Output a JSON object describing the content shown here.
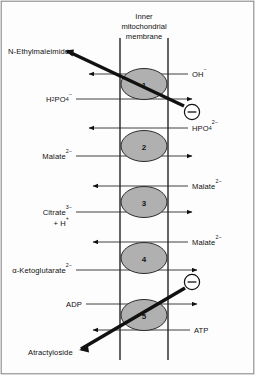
{
  "figure": {
    "title_lines": [
      "Inner",
      "mitochondrial",
      "membrane"
    ],
    "membrane": {
      "left_x": 120,
      "right_x": 168,
      "top_y": 38,
      "bottom_y": 360,
      "color": "#4a4a4a"
    },
    "frame": {
      "color": "#7a7a7a"
    },
    "carrier_fill": "#b0b0b0",
    "carrier_stroke": "#2b2b2b",
    "inhibitor_line_color": "#111111"
  },
  "carriers": [
    {
      "id": "carrier-1",
      "label": "1",
      "cx": 144,
      "cy": 84
    },
    {
      "id": "carrier-2",
      "label": "2",
      "cx": 144,
      "cy": 146
    },
    {
      "id": "carrier-3",
      "label": "3",
      "cx": 144,
      "cy": 202
    },
    {
      "id": "carrier-4",
      "label": "4",
      "cx": 144,
      "cy": 258
    },
    {
      "id": "carrier-5",
      "label": "5",
      "cx": 144,
      "cy": 315
    }
  ],
  "left_labels": [
    {
      "id": "label-nem",
      "text": "N-Ethylmaleimide",
      "x": 8,
      "y": 52
    },
    {
      "id": "label-h2po4",
      "base": "H",
      "sub": "2",
      "mid": "PO",
      "sub2": "4",
      "charge": "−",
      "x": 40,
      "y": 101
    },
    {
      "id": "label-malate-in",
      "base": "Malate",
      "charge": "2−",
      "x": 40,
      "y": 157
    },
    {
      "id": "label-citrate",
      "base": "Citrate",
      "charge": "3−",
      "second_line": "+ H",
      "second_charge": "+",
      "x": 40,
      "y": 213
    },
    {
      "id": "label-akg",
      "base": "α-Ketoglutarate",
      "charge": "2−",
      "x": 8,
      "y": 270
    },
    {
      "id": "label-adp",
      "text": "ADP",
      "x": 66,
      "y": 305
    },
    {
      "id": "label-atractyloside",
      "text": "Atractyloside",
      "x": 28,
      "y": 353
    }
  ],
  "right_labels": [
    {
      "id": "label-oh",
      "base": "OH",
      "charge": "−",
      "x": 192,
      "y": 74
    },
    {
      "id": "label-hpo4",
      "base": "HPO",
      "sub": "4",
      "charge": "2−",
      "x": 192,
      "y": 128
    },
    {
      "id": "label-malate-out-1",
      "base": "Malate",
      "charge": "2−",
      "x": 192,
      "y": 186
    },
    {
      "id": "label-malate-out-2",
      "base": "Malate",
      "charge": "2−",
      "x": 192,
      "y": 242
    },
    {
      "id": "label-atp",
      "text": "ATP",
      "x": 194,
      "y": 329
    }
  ],
  "arrows": [
    {
      "id": "arrow-oh-out",
      "direction": "left",
      "y": 74,
      "from_x": 188,
      "to_x": 88
    },
    {
      "id": "arrow-h2po4-in",
      "direction": "right",
      "y": 99,
      "from_x": 76,
      "to_x": 193
    },
    {
      "id": "arrow-hpo4-out",
      "direction": "left",
      "y": 128,
      "from_x": 188,
      "to_x": 88
    },
    {
      "id": "arrow-malate-in-1",
      "direction": "right",
      "y": 156,
      "from_x": 76,
      "to_x": 193
    },
    {
      "id": "arrow-malate-out-1",
      "direction": "left",
      "y": 186,
      "from_x": 188,
      "to_x": 92
    },
    {
      "id": "arrow-citrate-in",
      "direction": "right",
      "y": 212,
      "from_x": 76,
      "to_x": 193
    },
    {
      "id": "arrow-malate-out-2",
      "direction": "left",
      "y": 242,
      "from_x": 188,
      "to_x": 92
    },
    {
      "id": "arrow-akg-in",
      "direction": "right",
      "y": 270,
      "from_x": 76,
      "to_x": 197
    },
    {
      "id": "arrow-adp-in",
      "direction": "right",
      "y": 304,
      "from_x": 86,
      "to_x": 197
    },
    {
      "id": "arrow-atp-out",
      "direction": "left",
      "y": 330,
      "from_x": 190,
      "to_x": 92
    }
  ],
  "inhibitors": [
    {
      "id": "inhibitor-nem",
      "label_ref": "label-nem",
      "symbol": "−",
      "circle_cx": 192,
      "circle_cy": 112,
      "line_from_x": 67,
      "line_from_y": 51,
      "line_to_x": 184,
      "line_to_y": 106
    },
    {
      "id": "inhibitor-atractyloside",
      "label_ref": "label-atractyloside",
      "symbol": "−",
      "circle_cx": 192,
      "circle_cy": 282,
      "line_from_x": 81,
      "line_from_y": 349,
      "line_to_x": 185,
      "line_to_y": 288
    }
  ]
}
